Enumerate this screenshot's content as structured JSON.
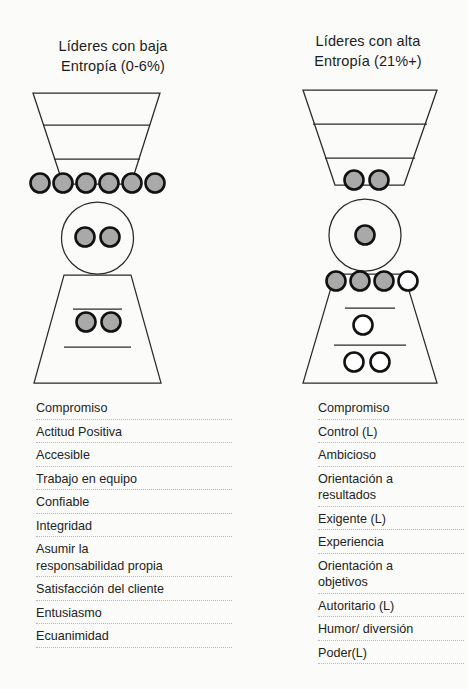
{
  "figure": {
    "background_color": "#fbfbfa",
    "ink_color": "#1d1d1d",
    "filled_marker_color": "#a8a8a8",
    "empty_marker_color": "#ffffff"
  },
  "panels": {
    "left": {
      "title": "Líderes con baja\nEntropía (0-6%)",
      "diagram": {
        "shape": "hourglass",
        "marker_groups": [
          {
            "name": "upper-funnel-neck-row",
            "filled": 6,
            "empty": 0
          },
          {
            "name": "center-circle",
            "filled": 2,
            "empty": 0
          },
          {
            "name": "lower-funnel-band",
            "filled": 2,
            "empty": 0
          }
        ],
        "total_filled": 10,
        "total_empty": 0
      },
      "attributes": [
        "Compromiso",
        "Actitud Positiva",
        "Accesible",
        "Trabajo en equipo",
        "Confiable",
        "Integridad",
        "Asumir la\nresponsabilidad propia",
        "Satisfacción del cliente",
        "Entusiasmo",
        "Ecuanimidad"
      ]
    },
    "right": {
      "title": "Líderes con alta\nEntropía (21%+)",
      "diagram": {
        "shape": "hourglass",
        "marker_groups": [
          {
            "name": "upper-funnel-neck-row",
            "filled": 2,
            "empty": 0
          },
          {
            "name": "center-circle",
            "filled": 1,
            "empty": 0
          },
          {
            "name": "lower-neck-row",
            "filled": 3,
            "empty": 1
          },
          {
            "name": "lower-funnel-band-upper",
            "filled": 0,
            "empty": 1
          },
          {
            "name": "lower-funnel-band-lower",
            "filled": 0,
            "empty": 2
          }
        ],
        "total_filled": 6,
        "total_empty": 4
      },
      "attributes": [
        "Compromiso",
        "Control (L)",
        "Ambicioso",
        "Orientación a\nresultados",
        "Exigente (L)",
        "Experiencia",
        "Orientación a\nobjetivos",
        "Autoritario (L)",
        "Humor/ diversión",
        "Poder(L)"
      ]
    }
  }
}
